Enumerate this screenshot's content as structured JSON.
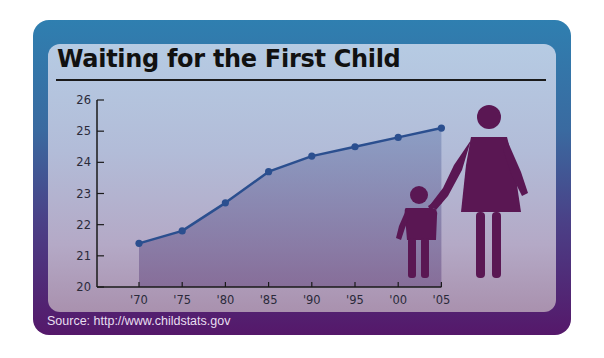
{
  "title": "Waiting for the First Child",
  "source": "Source: http://www.childstats.gov",
  "colors": {
    "line": "#2b4f8f",
    "area": "#6a5a8c",
    "figure": "#5a1753",
    "frame_top": "#2f7fb0",
    "frame_bottom": "#55186a"
  },
  "icons": [
    "mother-figure-icon",
    "child-figure-icon"
  ],
  "chart_data": {
    "type": "area",
    "title": "Waiting for the First Child",
    "xlabel": "",
    "ylabel": "",
    "categories": [
      "'70",
      "'75",
      "'80",
      "'85",
      "'90",
      "'95",
      "'00",
      "'05"
    ],
    "series": [
      {
        "name": "Average age of mother at first birth",
        "values": [
          21.4,
          21.8,
          22.7,
          23.7,
          24.2,
          24.5,
          24.8,
          25.1
        ]
      }
    ],
    "yticks": [
      "20",
      "21",
      "22",
      "23",
      "24",
      "25",
      "26"
    ],
    "ylim": [
      20,
      26
    ],
    "grid": false,
    "legend": "none",
    "annotations": [
      "Source: http://www.childstats.gov"
    ]
  }
}
